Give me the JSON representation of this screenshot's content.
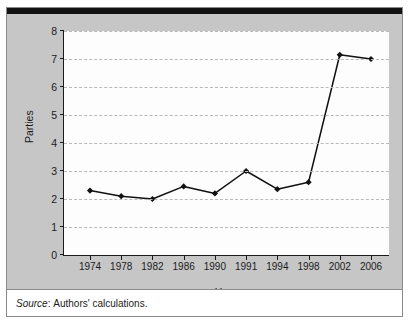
{
  "figure": {
    "footer": {
      "source_label": "Source",
      "source_separator": ": ",
      "source_text": "Authors' calculations."
    }
  },
  "chart_data": {
    "type": "line",
    "title": "",
    "xlabel": "Year",
    "ylabel": "Parties",
    "categories": [
      "1974",
      "1978",
      "1982",
      "1986",
      "1990",
      "1991",
      "1994",
      "1998",
      "2002",
      "2006"
    ],
    "values": [
      2.3,
      2.1,
      2.0,
      2.45,
      2.2,
      3.0,
      2.35,
      2.6,
      7.15,
      7.0
    ],
    "series": [
      {
        "name": "Parties",
        "values": [
          2.3,
          2.1,
          2.0,
          2.45,
          2.2,
          3.0,
          2.35,
          2.6,
          7.15,
          7.0
        ]
      }
    ],
    "ylim": [
      0,
      8
    ],
    "yticks": [
      0,
      1,
      2,
      3,
      4,
      5,
      6,
      7,
      8
    ],
    "ytick_labels": [
      "0",
      "1",
      "2",
      "3",
      "4",
      "5",
      "6",
      "7",
      "8"
    ],
    "grid": true,
    "grid_axis": "y",
    "grid_style": "dashed",
    "legend": "none",
    "marker": "diamond",
    "line_color": "#111111",
    "marker_color": "#111111",
    "grid_color": "#b9b9b9",
    "plot_background": "#fdfdfd",
    "figure_background": "#c6c6c6"
  }
}
